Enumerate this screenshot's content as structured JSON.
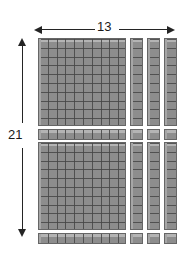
{
  "diagram": {
    "type": "base-ten-blocks-area-model",
    "width_label": "13",
    "height_label": "21",
    "product": 273,
    "background_color": "#ffffff",
    "block_color": "#8d8d8d",
    "block_highlight_color": "#b4b4b4",
    "block_outline_color": "#666666",
    "gridline_color": "#464646",
    "arrow_color": "#242424",
    "label_color": "#1a1a1a"
  },
  "arrows": {
    "horizontal": {
      "name": "width-dimension-arrow",
      "label": "13",
      "double_headed": true
    },
    "vertical": {
      "name": "height-dimension-arrow",
      "label": "21",
      "double_headed": true
    }
  },
  "blocks": {
    "hundreds_flats": [
      {
        "name": "hundreds-flat-top",
        "rows": 10,
        "cols": 10,
        "value": 100
      },
      {
        "name": "hundreds-flat-bottom",
        "rows": 10,
        "cols": 10,
        "value": 100
      }
    ],
    "vertical_rods_top": [
      {
        "name": "ten-rod-vertical-top-1",
        "units": 10,
        "value": 10
      },
      {
        "name": "ten-rod-vertical-top-2",
        "units": 10,
        "value": 10
      },
      {
        "name": "ten-rod-vertical-top-3",
        "units": 10,
        "value": 10
      }
    ],
    "vertical_rods_bottom": [
      {
        "name": "ten-rod-vertical-bottom-1",
        "units": 10,
        "value": 10
      },
      {
        "name": "ten-rod-vertical-bottom-2",
        "units": 10,
        "value": 10
      },
      {
        "name": "ten-rod-vertical-bottom-3",
        "units": 10,
        "value": 10
      }
    ],
    "horizontal_rods": [
      {
        "name": "ten-rod-horizontal-1",
        "units": 10,
        "value": 10
      },
      {
        "name": "ten-rod-horizontal-2",
        "units": 10,
        "value": 10
      }
    ],
    "unit_cubes": [
      {
        "name": "unit-cube-r1-c1",
        "value": 1
      },
      {
        "name": "unit-cube-r1-c2",
        "value": 1
      },
      {
        "name": "unit-cube-r1-c3",
        "value": 1
      },
      {
        "name": "unit-cube-r2-c1",
        "value": 1
      },
      {
        "name": "unit-cube-r2-c2",
        "value": 1
      },
      {
        "name": "unit-cube-r2-c3",
        "value": 1
      }
    ]
  }
}
